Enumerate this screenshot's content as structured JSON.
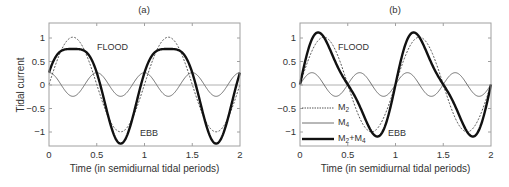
{
  "chart_data": [
    {
      "type": "line",
      "title": "(a)",
      "xlabel": "Time (in semidiurnal tidal periods)",
      "ylabel": "Tidal current",
      "xlim": [
        0,
        2
      ],
      "ylim": [
        -1.3,
        1.3
      ],
      "xticks": [
        0,
        0.5,
        1,
        1.5,
        2
      ],
      "xtick_labels": [
        "0",
        "0.5",
        "1",
        "1.5",
        "2"
      ],
      "yticks": [
        1,
        0.5,
        0,
        -0.5,
        -1
      ],
      "ytick_labels": [
        "1",
        "0.5",
        "0",
        "−0.5",
        "−1"
      ],
      "grid": false,
      "zero_line": true,
      "annotations": [
        {
          "text": "FLOOD",
          "x": 0.5,
          "y": 0.85
        },
        {
          "text": "EBB",
          "x": 0.95,
          "y": -1.0
        }
      ],
      "series": [
        {
          "name": "M2",
          "style": "dashed",
          "formula": "sin(2*pi*t)",
          "amplitude": 1.0,
          "x": [
            0,
            0.25,
            0.5,
            0.75,
            1,
            1.25,
            1.5,
            1.75,
            2
          ],
          "values": [
            0,
            1,
            0,
            -1,
            0,
            1,
            0,
            -1,
            0
          ]
        },
        {
          "name": "M4",
          "style": "thin",
          "formula": "0.25*cos(4*pi*t)",
          "amplitude": 0.25,
          "x": [
            0,
            0.25,
            0.5,
            0.75,
            1,
            1.25,
            1.5,
            1.75,
            2
          ],
          "values": [
            0.25,
            -0.25,
            0.25,
            -0.25,
            0.25,
            -0.25,
            0.25,
            -0.25,
            0.25
          ]
        },
        {
          "name": "M2+M4",
          "style": "thick",
          "formula": "sin(2*pi*t)+0.25*cos(4*pi*t)",
          "x": [
            0,
            0.25,
            0.5,
            0.75,
            1,
            1.25,
            1.5,
            1.75,
            2
          ],
          "values": [
            0.25,
            0.75,
            0.25,
            -1.25,
            0.25,
            0.75,
            0.25,
            -1.25,
            0.25
          ]
        }
      ]
    },
    {
      "type": "line",
      "title": "(b)",
      "xlabel": "Time (in semidiurnal tidal periods)",
      "ylabel": "",
      "xlim": [
        0,
        2
      ],
      "ylim": [
        -1.3,
        1.3
      ],
      "xticks": [
        0,
        0.5,
        1,
        1.5,
        2
      ],
      "xtick_labels": [
        "0",
        "0.5",
        "1",
        "1.5",
        "2"
      ],
      "yticks": [
        1,
        0.5,
        0,
        -0.5,
        -1
      ],
      "ytick_labels": [
        "1",
        "0.5",
        "0",
        "−0.5",
        "−1"
      ],
      "grid": false,
      "zero_line": true,
      "legend_position": "lower left",
      "legend": [
        "M2",
        "M4",
        "M2+M4"
      ],
      "annotations": [
        {
          "text": "FLOOD",
          "x": 0.4,
          "y": 0.85
        },
        {
          "text": "EBB",
          "x": 0.92,
          "y": -1.0
        }
      ],
      "series": [
        {
          "name": "M2",
          "style": "dashed",
          "formula": "sin(2*pi*t)",
          "amplitude": 1.0,
          "x": [
            0,
            0.25,
            0.5,
            0.75,
            1,
            1.25,
            1.5,
            1.75,
            2
          ],
          "values": [
            0,
            1,
            0,
            -1,
            0,
            1,
            0,
            -1,
            0
          ]
        },
        {
          "name": "M4",
          "style": "thin",
          "formula": "0.25*sin(4*pi*t)",
          "amplitude": 0.25,
          "x": [
            0,
            0.125,
            0.375,
            0.625,
            0.875,
            1,
            1.125,
            1.375,
            1.625,
            1.875,
            2
          ],
          "values": [
            0,
            0.25,
            -0.25,
            0.25,
            -0.25,
            0,
            0.25,
            -0.25,
            0.25,
            -0.25,
            0
          ]
        },
        {
          "name": "M2+M4",
          "style": "thick",
          "formula": "sin(2*pi*t)+0.25*sin(4*pi*t)",
          "x": [
            0,
            0.19,
            0.5,
            0.81,
            1,
            1.19,
            1.5,
            1.81,
            2
          ],
          "values": [
            0,
            1.1,
            0,
            -1.1,
            0,
            1.1,
            0,
            -1.1,
            0
          ]
        }
      ]
    }
  ],
  "panels": [
    {
      "title": "(a)",
      "ylabel": "Tidal current",
      "xlabel": "Time (in semidiurnal tidal periods)",
      "flood_label": "FLOOD",
      "ebb_label": "EBB",
      "xtick_labels": [
        "0",
        "0.5",
        "1",
        "1.5",
        "2"
      ],
      "ytick_labels": [
        "1",
        "0.5",
        "0",
        "−0.5",
        "−1"
      ]
    },
    {
      "title": "(b)",
      "xlabel": "Time (in semidiurnal tidal periods)",
      "flood_label": "FLOOD",
      "ebb_label": "EBB",
      "xtick_labels": [
        "0",
        "0.5",
        "1",
        "1.5",
        "2"
      ],
      "ytick_labels": [
        "1",
        "0.5",
        "0",
        "−0.5",
        "−1"
      ],
      "legend": {
        "m2": {
          "base": "M",
          "sub": "2"
        },
        "m4": {
          "base": "M",
          "sub": "4"
        },
        "sum": {
          "base1": "M",
          "sub1": "2",
          "plus": "+M",
          "sub2": "4"
        }
      }
    }
  ],
  "colors": {
    "axis": "#a0a0a0",
    "zero_line": "#b0b0b0",
    "m2": "#555555",
    "m4": "#707070",
    "sum": "#111111",
    "text": "#333333"
  }
}
